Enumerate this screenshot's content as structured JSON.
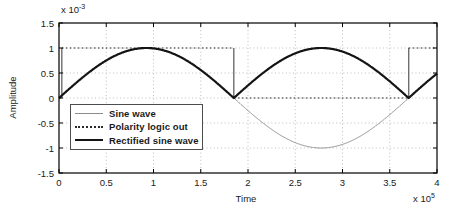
{
  "figure": {
    "ylabel": "Amplitude",
    "xlabel": "Time",
    "y_exponent_base": "x 10",
    "y_exponent_sup": "-3",
    "x_exponent_base": "x 10",
    "x_exponent_sup": "5"
  },
  "axes": {
    "x_tick_labels": [
      "0",
      "0.5",
      "1",
      "1.5",
      "2",
      "2.5",
      "3",
      "3.5",
      "4"
    ],
    "y_tick_labels": [
      "1.5",
      "1",
      "0.5",
      "0",
      "-0.5",
      "-1",
      "-1.5"
    ]
  },
  "legend": {
    "items": [
      {
        "label": "Sine wave",
        "style": "thin-solid",
        "color": "#8c8c8c"
      },
      {
        "label": "Polarity logic out",
        "style": "dotted",
        "color": "#2b2b2b"
      },
      {
        "label": "Rectified sine wave",
        "style": "thick-solid",
        "color": "#141414"
      }
    ]
  },
  "chart_data": {
    "type": "line",
    "title": "",
    "xlabel": "Time",
    "ylabel": "Amplitude",
    "x_exponent": 5,
    "y_exponent": -3,
    "xlim": [
      0,
      400000
    ],
    "ylim": [
      -0.0015,
      0.0015
    ],
    "x_tick_values": [
      0,
      50000,
      100000,
      150000,
      200000,
      250000,
      300000,
      350000,
      400000
    ],
    "y_tick_values": [
      -0.0015,
      -0.001,
      -0.0005,
      0,
      0.0005,
      0.001,
      0.0015
    ],
    "grid": true,
    "legend_position": "lower-left",
    "series": [
      {
        "name": "Sine wave",
        "model": "sine",
        "amplitude": 0.001,
        "period": 370000,
        "phase": 0,
        "color": "#8c8c8c",
        "width": 1,
        "dash": "none"
      },
      {
        "name": "Polarity logic out",
        "model": "steps",
        "points": [
          [
            0,
            0
          ],
          [
            3000,
            0
          ],
          [
            3000,
            0.001
          ],
          [
            185000,
            0.001
          ],
          [
            185000,
            0
          ],
          [
            370000,
            0
          ],
          [
            370000,
            0.001
          ],
          [
            400000,
            0.001
          ]
        ],
        "color": "#2b2b2b",
        "width": 1.1,
        "dash": "dotted"
      },
      {
        "name": "Rectified sine wave",
        "model": "abs_sine",
        "amplitude": 0.001,
        "period": 370000,
        "phase": 0,
        "color": "#141414",
        "width": 2.2,
        "dash": "none"
      }
    ]
  }
}
